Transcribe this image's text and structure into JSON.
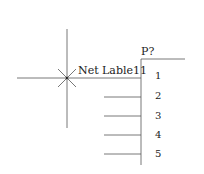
{
  "net_label": {
    "text": "Net Lable11",
    "cursor": "crosshair-cursor"
  },
  "component": {
    "designator": "P?",
    "pins": [
      "1",
      "2",
      "3",
      "4",
      "5"
    ]
  },
  "colors": {
    "line": "#555555",
    "text": "#222222",
    "background": "#ffffff"
  }
}
